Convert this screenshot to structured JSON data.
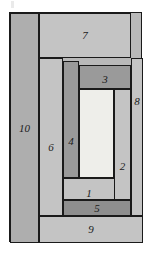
{
  "figure": {
    "type": "rectangle-partition-diagram",
    "title": "",
    "outer": {
      "x": 9,
      "y": 12,
      "width": 133,
      "height": 230
    },
    "border_color": "#1a1a1a",
    "palette": {
      "light_white": "#eeeeea",
      "light_gray": "#c4c4c4",
      "mid_gray": "#b9b9b9",
      "gray": "#aeaeae",
      "dark_gray": "#9a9a9a",
      "darkest_gray": "#8e8e8e",
      "page_background": "#ffffff"
    },
    "region_count": 10,
    "regions": [
      {
        "id": "1",
        "label": "1",
        "x": 62,
        "y": 177,
        "width": 52,
        "height": 22,
        "fill": "#c4c4c4",
        "label_dx": 0,
        "label_dy": 4
      },
      {
        "id": "2",
        "label": "2",
        "x": 113,
        "y": 88,
        "width": 17,
        "height": 111,
        "fill": "#c4c4c4",
        "label_dx": 0,
        "label_dy": 22
      },
      {
        "id": "3",
        "label": "3",
        "x": 78,
        "y": 64,
        "width": 52,
        "height": 24,
        "fill": "#9a9a9a",
        "label_dx": 0,
        "label_dy": 2
      },
      {
        "id": "4",
        "label": "4",
        "x": 62,
        "y": 60,
        "width": 16,
        "height": 117,
        "fill": "#9a9a9a",
        "label_dx": 0,
        "label_dy": 22
      },
      {
        "id": "5",
        "label": "5",
        "x": 62,
        "y": 199,
        "width": 68,
        "height": 16,
        "fill": "#8e8e8e",
        "label_dx": 0,
        "label_dy": 0
      },
      {
        "id": "6",
        "label": "6",
        "x": 38,
        "y": 57,
        "width": 24,
        "height": 158,
        "fill": "#c4c4c4",
        "label_dx": 0,
        "label_dy": 10
      },
      {
        "id": "7",
        "label": "7",
        "x": 38,
        "y": 12,
        "width": 92,
        "height": 45,
        "fill": "#c4c4c4",
        "label_dx": 0,
        "label_dy": 0
      },
      {
        "id": "8",
        "label": "8",
        "x": 130,
        "y": 57,
        "width": 12,
        "height": 158,
        "fill": "#c4c4c4",
        "label_dx": 0,
        "label_dy": -36
      },
      {
        "id": "9",
        "label": "9",
        "x": 38,
        "y": 215,
        "width": 104,
        "height": 27,
        "fill": "#c4c4c4",
        "label_dx": 0,
        "label_dy": 0
      },
      {
        "id": "10",
        "label": "10",
        "x": 9,
        "y": 12,
        "width": 29,
        "height": 230,
        "fill": "#aeaeae",
        "label_dx": 0,
        "label_dy": 0
      }
    ],
    "inner_blank": {
      "id": "center",
      "label": "",
      "x": 78,
      "y": 88,
      "width": 35,
      "height": 89,
      "fill": "#eeeeea"
    }
  }
}
